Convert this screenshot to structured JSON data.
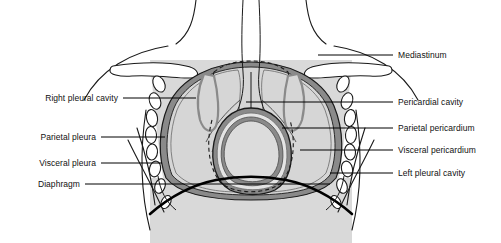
{
  "figure": {
    "colors": {
      "outline": "#000000",
      "lung_fill": "#d6d6d6",
      "cavity_fill": "#c9c9c9",
      "membrane_gray": "#8a8a8a",
      "body_fill": "#d9d9d9",
      "heart_fill": "#dcdcdc",
      "bone_white": "#ffffff",
      "background": "#ffffff",
      "leader_line": "#000000",
      "text": "#111111"
    }
  },
  "labels": {
    "left": [
      {
        "id": "right-pleural-cavity",
        "text": "Right pleural cavity",
        "text_x": 118,
        "text_y": 98,
        "line_x1": 123,
        "line_y1": 98,
        "line_x2": 196,
        "line_y2": 98
      },
      {
        "id": "parietal-pleura",
        "text": "Parietal pleura",
        "text_x": 96,
        "text_y": 137,
        "line_x1": 101,
        "line_y1": 137,
        "line_x2": 165,
        "line_y2": 137
      },
      {
        "id": "visceral-pleura",
        "text": "Visceral pleura",
        "text_x": 96,
        "text_y": 163,
        "line_x1": 101,
        "line_y1": 163,
        "line_x2": 162,
        "line_y2": 163
      },
      {
        "id": "diaphragm",
        "text": "Diaphragm",
        "text_x": 80,
        "text_y": 184,
        "line_x1": 85,
        "line_y1": 184,
        "line_x2": 330,
        "line_y2": 184
      }
    ],
    "right": [
      {
        "id": "mediastinum",
        "text": "Mediastinum",
        "text_x": 398,
        "text_y": 55,
        "line_x1": 318,
        "line_y1": 55,
        "line_x2": 393,
        "line_y2": 55
      },
      {
        "id": "pericardial-cavity",
        "text": "Pericardial cavity",
        "text_x": 398,
        "text_y": 102,
        "line_x1": 246,
        "line_y1": 102,
        "line_x2": 393,
        "line_y2": 102
      },
      {
        "id": "parietal-pericardium",
        "text": "Parietal pericardium",
        "text_x": 398,
        "text_y": 128,
        "line_x1": 282,
        "line_y1": 128,
        "line_x2": 393,
        "line_y2": 128
      },
      {
        "id": "visceral-pericardium",
        "text": "Visceral pericardium",
        "text_x": 398,
        "text_y": 150,
        "line_x1": 300,
        "line_y1": 150,
        "line_x2": 393,
        "line_y2": 150
      },
      {
        "id": "left-pleural-cavity",
        "text": "Left pleural cavity",
        "text_x": 398,
        "text_y": 173,
        "line_x1": 330,
        "line_y1": 173,
        "line_x2": 393,
        "line_y2": 173
      }
    ]
  }
}
